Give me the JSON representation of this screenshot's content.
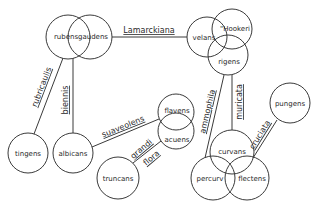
{
  "nodes": [
    {
      "id": "rubens",
      "label": "rubens",
      "cx": 68,
      "cy": 37,
      "r": 22,
      "lx": 66,
      "ly": 39
    },
    {
      "id": "gaudens",
      "label": "gaudens",
      "cx": 90,
      "cy": 37,
      "r": 22,
      "lx": 93,
      "ly": 39
    },
    {
      "id": "velans",
      "label": "velans",
      "cx": 207,
      "cy": 37,
      "r": 20,
      "lx": 204,
      "ly": 40
    },
    {
      "id": "hookeri",
      "label": "\"Hookeri",
      "cx": 232,
      "cy": 29,
      "r": 20,
      "lx": 235,
      "ly": 31
    },
    {
      "id": "rigens",
      "label": "rigens",
      "cx": 228,
      "cy": 55,
      "r": 20,
      "lx": 229,
      "ly": 64
    },
    {
      "id": "tingens",
      "label": "tingens",
      "cx": 28,
      "cy": 153,
      "r": 20,
      "lx": 28,
      "ly": 156
    },
    {
      "id": "albicans",
      "label": "albicans",
      "cx": 73,
      "cy": 153,
      "r": 20,
      "lx": 73,
      "ly": 156
    },
    {
      "id": "flavens",
      "label": "flavens",
      "cx": 176,
      "cy": 112,
      "r": 18,
      "lx": 177,
      "ly": 113
    },
    {
      "id": "acuens",
      "label": "acuens",
      "cx": 176,
      "cy": 131,
      "r": 18,
      "lx": 177,
      "ly": 142
    },
    {
      "id": "truncans",
      "label": "truncans",
      "cx": 118,
      "cy": 178,
      "r": 21,
      "lx": 118,
      "ly": 181
    },
    {
      "id": "pungens",
      "label": "pungens",
      "cx": 290,
      "cy": 103,
      "r": 20,
      "lx": 290,
      "ly": 106
    },
    {
      "id": "curvans",
      "label": "curvans",
      "cx": 232,
      "cy": 152,
      "r": 22,
      "lx": 232,
      "ly": 154
    },
    {
      "id": "percurv",
      "label": "percurv",
      "cx": 213,
      "cy": 178,
      "r": 22,
      "lx": 210,
      "ly": 181
    },
    {
      "id": "flectens",
      "label": "flectens",
      "cx": 247,
      "cy": 178,
      "r": 22,
      "lx": 252,
      "ly": 181
    }
  ],
  "edges": [
    {
      "id": "lamarckiana",
      "label": "Lamarckiana",
      "x1": 112,
      "y1": 37,
      "x2": 187,
      "y2": 37,
      "lx": 149,
      "ly": 33,
      "rot": 0
    },
    {
      "id": "rubricaulis",
      "label": "rubricaulis",
      "x1": 63,
      "y1": 58,
      "x2": 34,
      "y2": 134,
      "lx": 44,
      "ly": 88,
      "rot": -69
    },
    {
      "id": "biennis",
      "label": "biennis",
      "x1": 73,
      "y1": 58,
      "x2": 73,
      "y2": 133,
      "lx": 68,
      "ly": 100,
      "rot": -90
    },
    {
      "id": "suaveolens",
      "label": "suaveolens",
      "x1": 92,
      "y1": 147,
      "x2": 159,
      "y2": 119,
      "lx": 124,
      "ly": 129,
      "rot": -22
    },
    {
      "id": "grandiflora_1",
      "label": "grandi",
      "x1": 133,
      "y1": 163,
      "x2": 161,
      "y2": 141,
      "lx": 143,
      "ly": 151,
      "rot": -40
    },
    {
      "id": "grandiflora_2",
      "label": "flora",
      "x1": 0,
      "y1": 0,
      "x2": 0,
      "y2": 0,
      "lx": 153,
      "ly": 160,
      "rot": -40
    },
    {
      "id": "ammophila",
      "label": "ammophila",
      "x1": 224,
      "y1": 75,
      "x2": 205,
      "y2": 158,
      "lx": 210,
      "ly": 112,
      "rot": -77
    },
    {
      "id": "muricata",
      "label": "muricata",
      "x1": 232,
      "y1": 75,
      "x2": 232,
      "y2": 130,
      "lx": 242,
      "ly": 102,
      "rot": -90
    },
    {
      "id": "cruciata",
      "label": "cruciata",
      "x1": 277,
      "y1": 120,
      "x2": 253,
      "y2": 158,
      "lx": 262,
      "ly": 136,
      "rot": -58
    }
  ]
}
